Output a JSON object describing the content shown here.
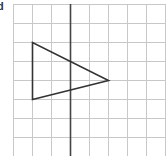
{
  "figure": {
    "label": "d",
    "grid": {
      "origin_x": 13,
      "origin_y": 4,
      "cell_size": 19,
      "columns": 8,
      "rows": 8,
      "line_color": "#c8c8c8"
    },
    "mirror_line": {
      "type": "vertical",
      "grid_column": 3,
      "color": "#444444"
    },
    "shape": {
      "type": "triangle",
      "grid_vertices": [
        [
          1,
          2
        ],
        [
          1,
          5
        ],
        [
          5,
          4
        ]
      ],
      "stroke_color": "#333333"
    }
  }
}
